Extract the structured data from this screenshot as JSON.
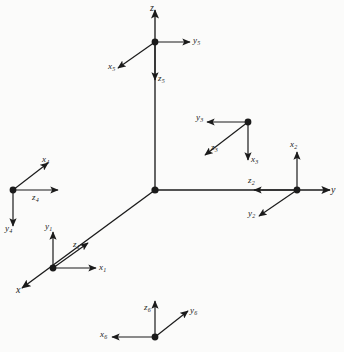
{
  "figure": {
    "type": "coordinate-frame-diagram",
    "background_color": "#fbfbfa",
    "stroke_color": "#1b1b1b",
    "node_color": "#1b1b1b",
    "width": 344,
    "height": 352
  },
  "global_axes": [
    {
      "id": "axis-z",
      "label": "z",
      "direction": "up",
      "from": [
        155,
        190
      ],
      "to": [
        155,
        10
      ]
    },
    {
      "id": "axis-y",
      "label": "y",
      "direction": "right",
      "from": [
        155,
        190
      ],
      "to": [
        330,
        190
      ]
    },
    {
      "id": "axis-x",
      "label": "x",
      "direction": "down-left",
      "from": [
        155,
        190
      ],
      "to": [
        22,
        288
      ]
    }
  ],
  "global_axis_labels": [
    {
      "name": "z",
      "text": "z",
      "x": 150,
      "y": 3
    },
    {
      "name": "y",
      "text": "y",
      "x": 331,
      "y": 185
    },
    {
      "name": "x",
      "text": "x",
      "x": 16,
      "y": 285
    }
  ],
  "origin": {
    "name": "global-origin",
    "x": 155,
    "y": 190
  },
  "frames": [
    {
      "id": 1,
      "name": "frame-1",
      "node": [
        53,
        268
      ],
      "axes": [
        {
          "axis": "x",
          "label": "x",
          "sub": "1",
          "to": [
            96,
            268
          ],
          "label_x": 99,
          "label_y": 263
        },
        {
          "axis": "y",
          "label": "y",
          "sub": "1",
          "to": [
            53,
            232
          ],
          "label_x": 45,
          "label_y": 222
        },
        {
          "axis": "z",
          "label": "z",
          "sub": "1",
          "to": [
            88,
            243
          ],
          "label_x": 73,
          "label_y": 240
        }
      ]
    },
    {
      "id": 2,
      "name": "frame-2",
      "node": [
        297,
        190
      ],
      "axes": [
        {
          "axis": "x",
          "label": "x",
          "sub": "2",
          "to": [
            297,
            152
          ],
          "label_x": 290,
          "label_y": 140
        },
        {
          "axis": "y",
          "label": "y",
          "sub": "2",
          "to": [
            259,
            216
          ],
          "label_x": 248,
          "label_y": 209
        },
        {
          "axis": "z",
          "label": "z",
          "sub": "2",
          "to": [
            254,
            190
          ],
          "label_x": 248,
          "label_y": 176
        }
      ]
    },
    {
      "id": 3,
      "name": "frame-3",
      "node": [
        248,
        122
      ],
      "axes": [
        {
          "axis": "x",
          "label": "x",
          "sub": "3",
          "to": [
            248,
            160
          ],
          "label_x": 251,
          "label_y": 155
        },
        {
          "axis": "y",
          "label": "y",
          "sub": "3",
          "to": [
            207,
            122
          ],
          "label_x": 196,
          "label_y": 113
        },
        {
          "axis": "z",
          "label": "z",
          "sub": "3",
          "to": [
            205,
            155
          ],
          "label_x": 211,
          "label_y": 143
        }
      ]
    },
    {
      "id": 4,
      "name": "frame-4",
      "node": [
        13,
        190
      ],
      "axes": [
        {
          "axis": "x",
          "label": "x",
          "sub": "4",
          "to": [
            48,
            163
          ],
          "label_x": 42,
          "label_y": 155
        },
        {
          "axis": "y",
          "label": "y",
          "sub": "4",
          "to": [
            13,
            226
          ],
          "label_x": 5,
          "label_y": 224
        },
        {
          "axis": "z",
          "label": "z",
          "sub": "4",
          "to": [
            58,
            190
          ],
          "label_x": 32,
          "label_y": 193
        }
      ]
    },
    {
      "id": 5,
      "name": "frame-5",
      "node": [
        155,
        42
      ],
      "axes": [
        {
          "axis": "x",
          "label": "x",
          "sub": "5",
          "to": [
            118,
            68
          ],
          "label_x": 108,
          "label_y": 62
        },
        {
          "axis": "y",
          "label": "y",
          "sub": "5",
          "to": [
            190,
            42
          ],
          "label_x": 193,
          "label_y": 36
        },
        {
          "axis": "z",
          "label": "z",
          "sub": "5",
          "to": [
            155,
            80
          ],
          "label_x": 158,
          "label_y": 74
        }
      ]
    },
    {
      "id": 6,
      "name": "frame-6",
      "node": [
        155,
        337
      ],
      "axes": [
        {
          "axis": "x",
          "label": "x",
          "sub": "6",
          "to": [
            112,
            337
          ],
          "label_x": 100,
          "label_y": 330
        },
        {
          "axis": "y",
          "label": "y",
          "sub": "6",
          "to": [
            188,
            311
          ],
          "label_x": 190,
          "label_y": 306
        },
        {
          "axis": "z",
          "label": "z",
          "sub": "6",
          "to": [
            155,
            301
          ],
          "label_x": 144,
          "label_y": 303
        }
      ]
    }
  ]
}
